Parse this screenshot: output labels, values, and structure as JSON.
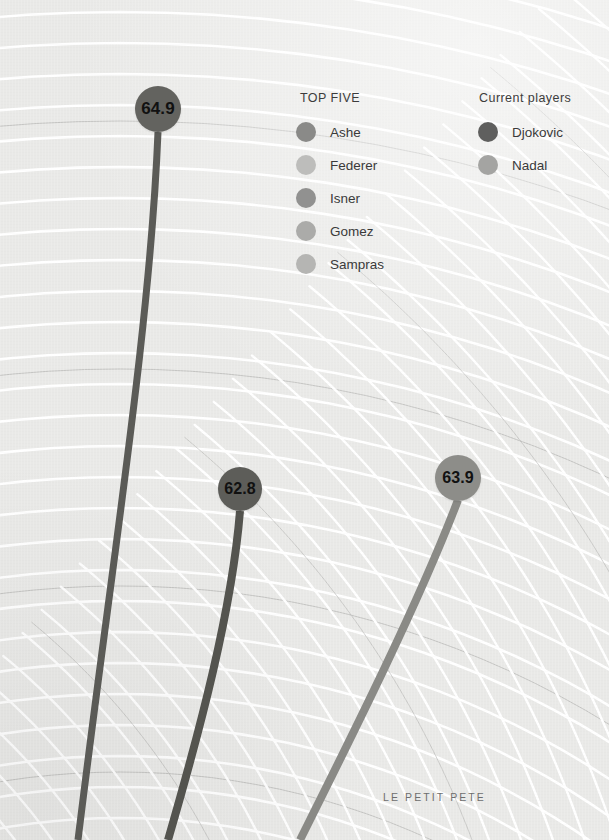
{
  "canvas": {
    "width": 609,
    "height": 840,
    "background_color": "#e9e9e7",
    "arc_line_color": "#ffffff",
    "accent_arc_color": "#b9b9b7"
  },
  "legend_groups": [
    {
      "key": "top_five",
      "title": "TOP FIVE",
      "x": 300,
      "y": 91,
      "items": [
        {
          "label": "Ashe",
          "color": "#8a8a88",
          "dot_x": 296,
          "dot_y": 132
        },
        {
          "label": "Federer",
          "color": "#bdbdbb",
          "dot_x": 296,
          "dot_y": 165
        },
        {
          "label": "Isner",
          "color": "#919190",
          "dot_x": 296,
          "dot_y": 198
        },
        {
          "label": "Gomez",
          "color": "#ababa9",
          "dot_x": 296,
          "dot_y": 231
        },
        {
          "label": "Sampras",
          "color": "#b5b5b3",
          "dot_x": 296,
          "dot_y": 264
        }
      ]
    },
    {
      "key": "current_players",
      "title": "Current players",
      "x": 479,
      "y": 91,
      "items": [
        {
          "label": "Djokovic",
          "color": "#5f5f5e",
          "dot_x": 478,
          "dot_y": 132
        },
        {
          "label": "Nadal",
          "color": "#a4a4a2",
          "dot_x": 478,
          "dot_y": 165
        }
      ]
    }
  ],
  "data_points": [
    {
      "id": "serve-64-9",
      "value": "64.9",
      "marker_color": "#63635f",
      "stem_color": "#5b5b57",
      "cx": 158,
      "cy": 109,
      "r": 23,
      "font_size": 17,
      "stem_width": 7,
      "stem_path": "M 158 132 C 150 330, 112 560, 78 840"
    },
    {
      "id": "serve-62-8",
      "value": "62.8",
      "marker_color": "#5d5d59",
      "stem_color": "#54544f",
      "cx": 240,
      "cy": 489,
      "r": 22,
      "font_size": 16,
      "stem_width": 8,
      "stem_path": "M 240 511 C 232 610, 200 730, 168 840"
    },
    {
      "id": "serve-63-9",
      "value": "63.9",
      "marker_color": "#8d8d89",
      "stem_color": "#8a8a86",
      "cx": 458,
      "cy": 478,
      "r": 23,
      "font_size": 16,
      "stem_width": 8,
      "stem_path": "M 458 500 C 420 600, 355 730, 300 840"
    }
  ],
  "credit": {
    "text": "LE PETIT PETE",
    "x": 383,
    "y": 791
  }
}
